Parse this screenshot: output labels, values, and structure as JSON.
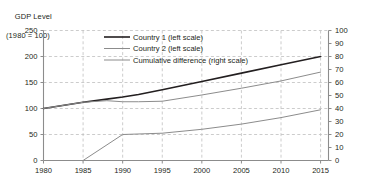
{
  "chart_data": {
    "type": "line",
    "title": "GDP Level",
    "subtitle": "(1980 = 100)",
    "xlabel": "",
    "ylabel": "GDP Level (1980 = 100)",
    "ylabel_right": "Cumulative difference",
    "grid": true,
    "legend_position": "top-center",
    "xlim": [
      1980,
      2016
    ],
    "ylim": [
      0,
      250
    ],
    "ylim_right": [
      0,
      100
    ],
    "x_ticks": [
      "1980",
      "1985",
      "1990",
      "1995",
      "2000",
      "2005",
      "2010",
      "2015"
    ],
    "x_tick_values": [
      1980,
      1985,
      1990,
      1995,
      2000,
      2005,
      2010,
      2015
    ],
    "y_ticks_left": [
      "0",
      "50",
      "100",
      "150",
      "200",
      "250"
    ],
    "y_tick_values_left": [
      0,
      50,
      100,
      150,
      200,
      250
    ],
    "y_ticks_right": [
      "0",
      "10",
      "20",
      "30",
      "40",
      "50",
      "60",
      "70",
      "80",
      "90",
      "100"
    ],
    "y_tick_values_right": [
      0,
      10,
      20,
      30,
      40,
      50,
      60,
      70,
      80,
      90,
      100
    ],
    "x": [
      1980,
      1985,
      1988,
      1990,
      1992,
      1995,
      2000,
      2005,
      2010,
      2015
    ],
    "series": [
      {
        "name": "Country 1 (left scale)",
        "axis": "left",
        "color": "#231f20",
        "width": 1.6,
        "x": [
          1980,
          1985,
          1988,
          1990,
          1992,
          1995,
          2000,
          2005,
          2010,
          2015
        ],
        "values": [
          100,
          112,
          118,
          122,
          127,
          136,
          152,
          168,
          184,
          200
        ]
      },
      {
        "name": "Country 2 (left scale)",
        "axis": "left",
        "color": "#8c8c8c",
        "width": 1.0,
        "x": [
          1980,
          1985,
          1988,
          1990,
          1992,
          1995,
          2000,
          2005,
          2010,
          2015
        ],
        "values": [
          100,
          112,
          115,
          113,
          113,
          114,
          126,
          139,
          153,
          170
        ]
      },
      {
        "name": "Cumulative difference (right scale)",
        "axis": "right",
        "color": "#8c8c8c",
        "width": 1.0,
        "x": [
          1985,
          1990,
          1995,
          2000,
          2005,
          2010,
          2015
        ],
        "values": [
          0,
          20,
          21,
          24,
          28,
          33,
          39
        ]
      }
    ],
    "legend": [
      {
        "label": "Country 1 (left scale)",
        "color": "#231f20",
        "width": 1.6
      },
      {
        "label": "Country 2 (left scale)",
        "color": "#8c8c8c",
        "width": 1.0
      },
      {
        "label": "Cumulative difference (right scale)",
        "color": "#8c8c8c",
        "width": 1.0
      }
    ],
    "colors": {
      "axis": "#8c8c8c",
      "grid": "#bfbfbf",
      "text": "#231f20",
      "background": "#ffffff"
    }
  }
}
